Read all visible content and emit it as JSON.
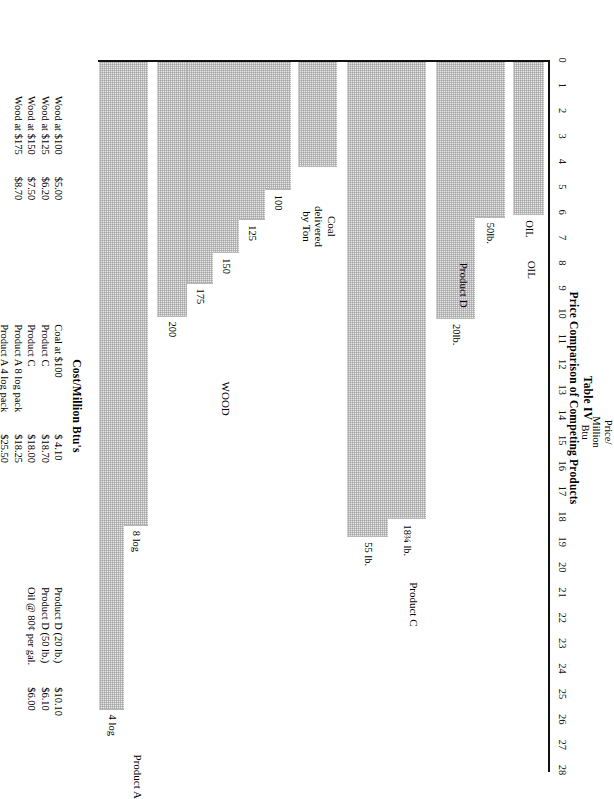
{
  "title": {
    "line1": "Table IV",
    "line2": "Price Comparison of Competing Products"
  },
  "axis": {
    "name_line1": "Price/",
    "name_line2": "Million",
    "name_line3": "Btu",
    "ticks": [
      "0",
      "1",
      "2",
      "3",
      "4",
      "5",
      "6",
      "7",
      "8",
      "9",
      "10",
      "11",
      "12",
      "13",
      "14",
      "15",
      "16",
      "17",
      "18",
      "19",
      "20",
      "21",
      "22",
      "23",
      "24",
      "25",
      "26",
      "27",
      "28"
    ]
  },
  "group_labels": {
    "oil": "OIL",
    "product_d": "Product D",
    "product_c": "Product C",
    "coal_l1": "Coal",
    "coal_l2": "delivered",
    "coal_l3": "by Ton",
    "wood": "WOOD",
    "product_a": "Product A"
  },
  "cost_table": {
    "title": "Cost/Million Btu's",
    "columns": [
      {
        "rows": [
          {
            "item": "Wood at $100",
            "price": "$5.00"
          },
          {
            "item": "Wood at $125",
            "price": "$6.20"
          },
          {
            "item": "Wood at $150",
            "price": "$7.50"
          },
          {
            "item": "Wood at $175",
            "price": "$8.70"
          }
        ]
      },
      {
        "rows": [
          {
            "item": "Coal at $100",
            "price": "$ 4.10"
          },
          {
            "item": "Product C",
            "price": "$18.70"
          },
          {
            "item": "Product C",
            "price": "$18.00"
          },
          {
            "item": "Product A  8 log pack",
            "price": "$18.25"
          },
          {
            "item": "Product A  4 log pack",
            "price": "$25.50"
          }
        ]
      },
      {
        "rows": [
          {
            "item": "Product D (20 lb.)",
            "price": "$10.10"
          },
          {
            "item": "Product D (50 lb.)",
            "price": "$6.10"
          },
          {
            "item": "Oil @ 80¢ per gal.",
            "price": "$6.00"
          }
        ]
      }
    ]
  },
  "chart_data": {
    "type": "bar",
    "orientation": "horizontal",
    "title": "Price Comparison of Competing Products",
    "xlabel": "Price/Million Btu",
    "ylabel": "",
    "xlim": [
      0,
      28
    ],
    "grid": false,
    "legend": "none",
    "categories": [
      "OIL",
      "50lb.",
      "20lb.",
      "18¾ lb.",
      "55 lb.",
      "Coal delivered by Ton",
      "100",
      "125",
      "150",
      "175",
      "200",
      "8 log",
      "4 log"
    ],
    "values": [
      6.0,
      6.1,
      10.1,
      18.0,
      18.7,
      4.1,
      5.0,
      6.2,
      7.5,
      8.7,
      10.0,
      18.25,
      25.5
    ],
    "bars": [
      {
        "label": "OIL",
        "value": 6.0,
        "group": "OIL"
      },
      {
        "label": "50lb.",
        "value": 6.1,
        "group": "Product D"
      },
      {
        "label": "20lb.",
        "value": 10.1,
        "group": "Product D"
      },
      {
        "label": "18¾ lb.",
        "value": 18.0,
        "group": "Product C"
      },
      {
        "label": "55 lb.",
        "value": 18.7,
        "group": "Product C"
      },
      {
        "label": "",
        "value": 4.1,
        "group": "Coal delivered by Ton"
      },
      {
        "label": "100",
        "value": 5.0,
        "group": "WOOD"
      },
      {
        "label": "125",
        "value": 6.2,
        "group": "WOOD"
      },
      {
        "label": "150",
        "value": 7.5,
        "group": "WOOD"
      },
      {
        "label": "175",
        "value": 8.7,
        "group": "WOOD"
      },
      {
        "label": "200",
        "value": 10.0,
        "group": "WOOD"
      },
      {
        "label": "8 log",
        "value": 18.25,
        "group": "Product A"
      },
      {
        "label": "4 log",
        "value": 25.5,
        "group": "Product A"
      }
    ]
  }
}
